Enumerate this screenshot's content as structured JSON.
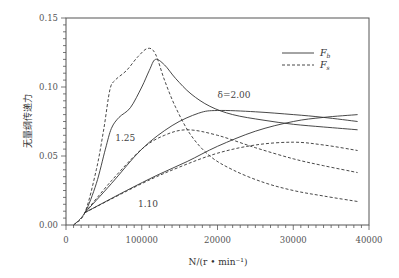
{
  "chart_data": {
    "type": "line",
    "title": "",
    "xlabel": "N/(r • min⁻¹)",
    "ylabel": "无量纲传递力",
    "xlim": [
      0,
      40000
    ],
    "ylim": [
      0,
      0.15
    ],
    "xticks": [
      0,
      10000,
      20000,
      30000,
      40000
    ],
    "xtick_labels": [
      "0",
      "100000",
      "20000",
      "30000",
      "40000"
    ],
    "yticks": [
      0.0,
      0.05,
      0.1,
      0.15
    ],
    "ytick_labels": [
      "0.00",
      "0.05",
      "0.10",
      "0.15"
    ],
    "grid": false,
    "legend": {
      "position": "upper right",
      "entries": [
        {
          "label": "F_b",
          "main": "F",
          "sub": "b",
          "style": "solid"
        },
        {
          "label": "F_s",
          "main": "F",
          "sub": "s",
          "style": "dashed"
        }
      ]
    },
    "annotations": [
      {
        "text": "δ=2.00",
        "x": 20000,
        "y": 0.092
      },
      {
        "text": "1.25",
        "x": 6500,
        "y": 0.061
      },
      {
        "text": "1.10",
        "x": 9500,
        "y": 0.013
      }
    ],
    "series": [
      {
        "name": "F_b δ=2.00",
        "style": "solid",
        "x": [
          1000,
          2500,
          4000,
          5200,
          6000,
          7000,
          8500,
          10000,
          11000,
          11800,
          13000,
          14500,
          16500,
          19000,
          22000,
          26000,
          30000,
          34000,
          38500
        ],
        "y": [
          0.0,
          0.009,
          0.03,
          0.055,
          0.07,
          0.078,
          0.085,
          0.1,
          0.112,
          0.12,
          0.116,
          0.106,
          0.095,
          0.086,
          0.08,
          0.076,
          0.073,
          0.071,
          0.069
        ]
      },
      {
        "name": "F_s δ=2.00",
        "style": "dashed",
        "x": [
          1000,
          2500,
          4000,
          5000,
          5800,
          6500,
          8000,
          9500,
          10800,
          11800,
          13000,
          14500,
          16500,
          19000,
          22000,
          26000,
          30000,
          34000,
          38500
        ],
        "y": [
          0.0,
          0.009,
          0.04,
          0.07,
          0.098,
          0.105,
          0.112,
          0.122,
          0.128,
          0.124,
          0.105,
          0.085,
          0.065,
          0.05,
          0.04,
          0.031,
          0.025,
          0.021,
          0.017
        ]
      },
      {
        "name": "F_b δ=1.25",
        "style": "solid",
        "x": [
          2500,
          6000,
          10000,
          14000,
          17500,
          20000,
          25000,
          30000,
          34000,
          38500
        ],
        "y": [
          0.009,
          0.03,
          0.055,
          0.072,
          0.081,
          0.083,
          0.082,
          0.08,
          0.078,
          0.075
        ]
      },
      {
        "name": "F_s δ=1.25",
        "style": "dashed",
        "x": [
          2500,
          6000,
          10000,
          13000,
          16000,
          20000,
          25000,
          30000,
          34000,
          38500
        ],
        "y": [
          0.009,
          0.032,
          0.055,
          0.065,
          0.069,
          0.065,
          0.056,
          0.048,
          0.043,
          0.038
        ]
      },
      {
        "name": "F_b δ=1.10",
        "style": "solid",
        "x": [
          2500,
          8000,
          12000,
          16000,
          20000,
          25000,
          30000,
          34000,
          38500
        ],
        "y": [
          0.009,
          0.025,
          0.036,
          0.046,
          0.057,
          0.068,
          0.075,
          0.078,
          0.08
        ]
      },
      {
        "name": "F_s δ=1.10",
        "style": "dashed",
        "x": [
          2500,
          10000,
          15000,
          20000,
          25000,
          30000,
          34000,
          38500
        ],
        "y": [
          0.009,
          0.03,
          0.042,
          0.052,
          0.058,
          0.06,
          0.058,
          0.054
        ]
      }
    ]
  }
}
